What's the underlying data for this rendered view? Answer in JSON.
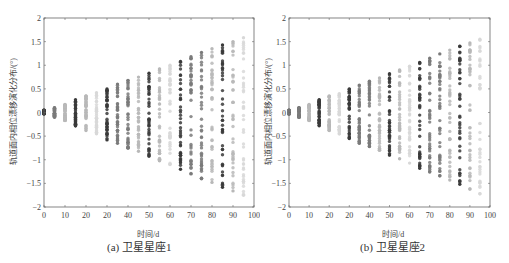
{
  "chart_data": [
    {
      "type": "scatter",
      "caption": "(a) 卫星星座1",
      "xlabel": "时间/d",
      "ylabel": "轨道面内相位漂移演化分布/(°)",
      "xlim": [
        0,
        100
      ],
      "ylim": [
        -2,
        2
      ],
      "xticks": [
        0,
        10,
        20,
        30,
        40,
        50,
        60,
        70,
        80,
        90,
        100
      ],
      "xtick_labels": [
        "0",
        "10",
        "20",
        "20",
        "40",
        "50",
        "60",
        "70",
        "80",
        "90",
        "100"
      ],
      "yticks": [
        -2,
        -1.5,
        -1,
        -0.5,
        0,
        0.5,
        1,
        1.5,
        2
      ],
      "ytick_labels": [
        "-2",
        "-1.5",
        "-1",
        "-0.5",
        "0",
        "0.5",
        "1",
        "1.5",
        "2"
      ],
      "grid": false,
      "series": [
        {
          "x": 0,
          "ymin": -0.03,
          "ymax": 0.05,
          "shade": "dark"
        },
        {
          "x": 5,
          "ymin": -0.1,
          "ymax": 0.1,
          "shade": "mid"
        },
        {
          "x": 10,
          "ymin": -0.17,
          "ymax": 0.17,
          "shade": "light"
        },
        {
          "x": 15,
          "ymin": -0.28,
          "ymax": 0.27,
          "shade": "dark"
        },
        {
          "x": 20,
          "ymin": -0.38,
          "ymax": 0.35,
          "shade": "light"
        },
        {
          "x": 25,
          "ymin": -0.45,
          "ymax": 0.42,
          "shade": "faint"
        },
        {
          "x": 30,
          "ymin": -0.58,
          "ymax": 0.5,
          "shade": "dark"
        },
        {
          "x": 35,
          "ymin": -0.65,
          "ymax": 0.6,
          "shade": "mid"
        },
        {
          "x": 40,
          "ymin": -0.75,
          "ymax": 0.68,
          "shade": "mid"
        },
        {
          "x": 45,
          "ymin": -0.82,
          "ymax": 0.75,
          "shade": "light"
        },
        {
          "x": 50,
          "ymin": -0.92,
          "ymax": 0.83,
          "shade": "dark"
        },
        {
          "x": 55,
          "ymin": -1.02,
          "ymax": 0.92,
          "shade": "light"
        },
        {
          "x": 60,
          "ymin": -1.1,
          "ymax": 1.0,
          "shade": "faint"
        },
        {
          "x": 65,
          "ymin": -1.2,
          "ymax": 1.08,
          "shade": "dark"
        },
        {
          "x": 70,
          "ymin": -1.3,
          "ymax": 1.18,
          "shade": "mid"
        },
        {
          "x": 75,
          "ymin": -1.4,
          "ymax": 1.27,
          "shade": "mid"
        },
        {
          "x": 80,
          "ymin": -1.48,
          "ymax": 1.35,
          "shade": "light"
        },
        {
          "x": 85,
          "ymin": -1.58,
          "ymax": 1.43,
          "shade": "dark"
        },
        {
          "x": 90,
          "ymin": -1.66,
          "ymax": 1.5,
          "shade": "light"
        },
        {
          "x": 95,
          "ymin": -1.75,
          "ymax": 1.58,
          "shade": "faint"
        }
      ]
    },
    {
      "type": "scatter",
      "caption": "(b) 卫星星座2",
      "xlabel": "时间/d",
      "ylabel": "轨道面内相位漂移演化分布/(°)",
      "xlim": [
        0,
        100
      ],
      "ylim": [
        -2,
        2
      ],
      "xticks": [
        0,
        10,
        20,
        30,
        40,
        50,
        60,
        70,
        80,
        90,
        100
      ],
      "xtick_labels": [
        "0",
        "10",
        "20",
        "20",
        "40",
        "50",
        "60",
        "70",
        "80",
        "90",
        "100"
      ],
      "yticks": [
        -2,
        -1.5,
        -1,
        -0.5,
        0,
        0.5,
        1,
        1.5,
        2
      ],
      "ytick_labels": [
        "-2",
        "-1.5",
        "-1",
        "-0.5",
        "0",
        "0.5",
        "1",
        "1.5",
        "2"
      ],
      "grid": false,
      "series": [
        {
          "x": 0,
          "ymin": -0.03,
          "ymax": 0.05,
          "shade": "mid"
        },
        {
          "x": 5,
          "ymin": -0.1,
          "ymax": 0.1,
          "shade": "mid"
        },
        {
          "x": 10,
          "ymin": -0.17,
          "ymax": 0.17,
          "shade": "light"
        },
        {
          "x": 15,
          "ymin": -0.28,
          "ymax": 0.27,
          "shade": "dark"
        },
        {
          "x": 20,
          "ymin": -0.38,
          "ymax": 0.35,
          "shade": "light"
        },
        {
          "x": 25,
          "ymin": -0.45,
          "ymax": 0.4,
          "shade": "faint"
        },
        {
          "x": 30,
          "ymin": -0.55,
          "ymax": 0.5,
          "shade": "dark"
        },
        {
          "x": 35,
          "ymin": -0.65,
          "ymax": 0.58,
          "shade": "mid"
        },
        {
          "x": 40,
          "ymin": -0.72,
          "ymax": 0.66,
          "shade": "mid"
        },
        {
          "x": 45,
          "ymin": -0.8,
          "ymax": 0.73,
          "shade": "light"
        },
        {
          "x": 50,
          "ymin": -0.9,
          "ymax": 0.82,
          "shade": "dark"
        },
        {
          "x": 55,
          "ymin": -0.98,
          "ymax": 0.9,
          "shade": "light"
        },
        {
          "x": 60,
          "ymin": -1.07,
          "ymax": 0.98,
          "shade": "faint"
        },
        {
          "x": 65,
          "ymin": -1.18,
          "ymax": 1.06,
          "shade": "dark"
        },
        {
          "x": 70,
          "ymin": -1.26,
          "ymax": 1.15,
          "shade": "mid"
        },
        {
          "x": 75,
          "ymin": -1.34,
          "ymax": 1.24,
          "shade": "mid"
        },
        {
          "x": 80,
          "ymin": -1.43,
          "ymax": 1.32,
          "shade": "light"
        },
        {
          "x": 85,
          "ymin": -1.52,
          "ymax": 1.4,
          "shade": "dark"
        },
        {
          "x": 90,
          "ymin": -1.62,
          "ymax": 1.47,
          "shade": "light"
        },
        {
          "x": 95,
          "ymin": -1.72,
          "ymax": 1.55,
          "shade": "faint"
        }
      ]
    }
  ],
  "shades": {
    "dark": "#3a3a3a",
    "mid": "#7a7a7a",
    "light": "#b8b8b8",
    "faint": "#d8d8d8"
  },
  "panels": [
    {
      "caption": "(a) 卫星星座1",
      "xlabel": "时间/d",
      "ylabel": "轨道面内相位漂移演化分布/(°)"
    },
    {
      "caption": "(b) 卫星星座2",
      "xlabel": "时间/d",
      "ylabel": "轨道面内相位漂移演化分布/(°)"
    }
  ]
}
